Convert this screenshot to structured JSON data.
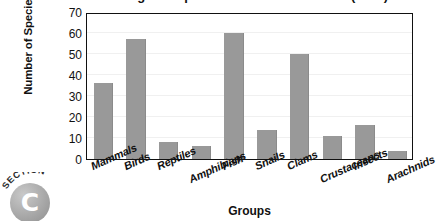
{
  "chart_data": {
    "type": "bar",
    "title": "Endangered Species of the United States (2003)",
    "xlabel": "Groups",
    "ylabel": "Number of Species",
    "ylim": [
      0,
      70
    ],
    "ytick_step": 10,
    "yticks": [
      70,
      60,
      50,
      40,
      30,
      20,
      10,
      0
    ],
    "grid": true,
    "legend": "none",
    "bar_color": "#999999",
    "axis_color": "#111111",
    "plot_background": "#ffffff",
    "gridline_color": "#f0f0f0",
    "categories": [
      "Mammals",
      "Birds",
      "Reptiles",
      "Amphibians",
      "Fish",
      "Snails",
      "Clams",
      "Crustaceans",
      "Insects",
      "Arachnids"
    ],
    "values": [
      36,
      57,
      8,
      6,
      60,
      14,
      50,
      11,
      16,
      4
    ]
  },
  "badge": {
    "word": "SECTION",
    "letter": "C"
  }
}
